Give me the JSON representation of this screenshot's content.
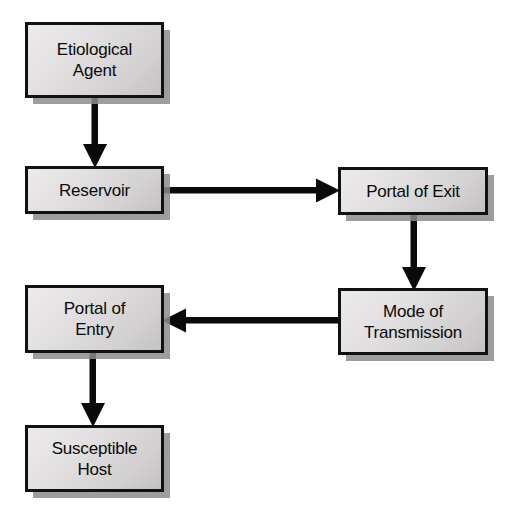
{
  "diagram": {
    "type": "flowchart",
    "background_color": "#ffffff",
    "node_fill_color": "#e0dede",
    "node_border_color": "#111111",
    "node_shadow_color": "#8c8c8c",
    "arrow_color": "#0a0a0a",
    "nodes": [
      {
        "id": "etiological-agent",
        "label": "Etiological\nAgent",
        "x": 25,
        "y": 22,
        "width": 139,
        "height": 76
      },
      {
        "id": "reservoir",
        "label": "Reservoir",
        "x": 25,
        "y": 166,
        "width": 139,
        "height": 48
      },
      {
        "id": "portal-of-exit",
        "label": "Portal of Exit",
        "x": 338,
        "y": 167,
        "width": 150,
        "height": 48
      },
      {
        "id": "mode-of-transmission",
        "label": "Mode of\nTransmission",
        "x": 338,
        "y": 288,
        "width": 150,
        "height": 67
      },
      {
        "id": "portal-of-entry",
        "label": "Portal of\nEntry",
        "x": 25,
        "y": 285,
        "width": 139,
        "height": 68
      },
      {
        "id": "susceptible-host",
        "label": "Susceptible\nHost",
        "x": 25,
        "y": 425,
        "width": 139,
        "height": 67
      }
    ],
    "edges": [
      {
        "id": "edge-agent-to-reservoir",
        "from": "etiological-agent",
        "to": "reservoir",
        "direction": "down",
        "label": ""
      },
      {
        "id": "edge-reservoir-to-exit",
        "from": "reservoir",
        "to": "portal-of-exit",
        "direction": "right",
        "label": ""
      },
      {
        "id": "edge-exit-to-transmission",
        "from": "portal-of-exit",
        "to": "mode-of-transmission",
        "direction": "down",
        "label": ""
      },
      {
        "id": "edge-transmission-to-entry",
        "from": "mode-of-transmission",
        "to": "portal-of-entry",
        "direction": "left",
        "label": ""
      },
      {
        "id": "edge-entry-to-host",
        "from": "portal-of-entry",
        "to": "susceptible-host",
        "direction": "down",
        "label": ""
      }
    ]
  }
}
